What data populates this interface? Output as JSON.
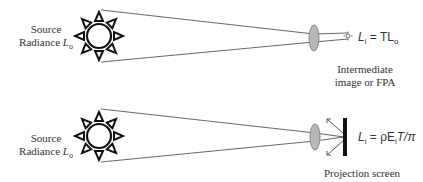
{
  "top": {
    "source_label_line1": "Source",
    "source_label_line2": "Radiance",
    "source_symbol": "L",
    "source_sub": "o",
    "equation": "L",
    "equation_sub": "i",
    "equation_rhs": " = TL",
    "equation_rhs_sub": "o",
    "caption_line1": "Intermediate",
    "caption_line2": "image or FPA"
  },
  "bottom": {
    "source_label_line1": "Source",
    "source_label_line2": "Radiance",
    "source_symbol": "L",
    "source_sub": "o",
    "equation": "L",
    "equation_sub": "i",
    "equation_rhs": " = ρE",
    "equation_rhs_sub": "i",
    "equation_tail": "T/π",
    "caption": "Projection screen"
  },
  "colors": {
    "line": "#555555",
    "lens_fill": "#b8b8b8",
    "screen": "#111111"
  }
}
